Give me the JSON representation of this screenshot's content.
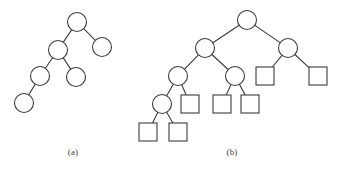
{
  "figure": {
    "background_color": "#ffffff",
    "stroke_color": "#3c3c3c",
    "node_fill": "#ffffff",
    "stroke_width": 1.1,
    "circle_radius": 9.5,
    "square_size": 18,
    "panels": [
      {
        "id": "a",
        "caption": "(a)",
        "caption_x": 73,
        "caption_y": 152,
        "description": "binary tree with internal nodes only",
        "nodes": [
          {
            "id": "a0",
            "shape": "circle",
            "x": 77,
            "y": 22,
            "level": 0,
            "name": "root"
          },
          {
            "id": "a1",
            "shape": "circle",
            "x": 58,
            "y": 50,
            "level": 1,
            "name": "left-child"
          },
          {
            "id": "a2",
            "shape": "circle",
            "x": 102,
            "y": 47,
            "level": 1,
            "name": "right-child"
          },
          {
            "id": "a3",
            "shape": "circle",
            "x": 40,
            "y": 76,
            "level": 2,
            "name": "left-left-child"
          },
          {
            "id": "a4",
            "shape": "circle",
            "x": 76,
            "y": 77,
            "level": 2,
            "name": "left-right-child"
          },
          {
            "id": "a5",
            "shape": "circle",
            "x": 24,
            "y": 103,
            "level": 3,
            "name": "left-left-left-child"
          }
        ],
        "edges": [
          {
            "from": "a0",
            "to": "a1"
          },
          {
            "from": "a0",
            "to": "a2"
          },
          {
            "from": "a1",
            "to": "a3"
          },
          {
            "from": "a1",
            "to": "a4"
          },
          {
            "from": "a3",
            "to": "a5"
          }
        ]
      },
      {
        "id": "b",
        "caption": "(b)",
        "caption_x": 232,
        "caption_y": 152,
        "description": "extended binary tree: circles are internal nodes, squares are external (leaf) nodes",
        "nodes": [
          {
            "id": "b0",
            "shape": "circle",
            "x": 247,
            "y": 20,
            "level": 0,
            "name": "root"
          },
          {
            "id": "b1",
            "shape": "circle",
            "x": 205,
            "y": 48,
            "level": 1,
            "name": "internal-left"
          },
          {
            "id": "b2",
            "shape": "circle",
            "x": 288,
            "y": 48,
            "level": 1,
            "name": "internal-right"
          },
          {
            "id": "b3",
            "shape": "circle",
            "x": 178,
            "y": 76,
            "level": 2,
            "name": "internal-left-left"
          },
          {
            "id": "b4",
            "shape": "circle",
            "x": 235,
            "y": 76,
            "level": 2,
            "name": "internal-left-right"
          },
          {
            "id": "b5",
            "shape": "square",
            "x": 265,
            "y": 76,
            "level": 2,
            "name": "external-right-left"
          },
          {
            "id": "b6",
            "shape": "square",
            "x": 318,
            "y": 76,
            "level": 2,
            "name": "external-right-right"
          },
          {
            "id": "b7",
            "shape": "circle",
            "x": 162,
            "y": 104,
            "level": 3,
            "name": "internal-deep"
          },
          {
            "id": "b8",
            "shape": "square",
            "x": 190,
            "y": 104,
            "level": 3,
            "name": "external-1"
          },
          {
            "id": "b9",
            "shape": "square",
            "x": 222,
            "y": 104,
            "level": 3,
            "name": "external-2"
          },
          {
            "id": "b10",
            "shape": "square",
            "x": 250,
            "y": 104,
            "level": 3,
            "name": "external-3"
          },
          {
            "id": "b11",
            "shape": "square",
            "x": 148,
            "y": 132,
            "level": 4,
            "name": "external-4"
          },
          {
            "id": "b12",
            "shape": "square",
            "x": 178,
            "y": 132,
            "level": 4,
            "name": "external-5"
          }
        ],
        "edges": [
          {
            "from": "b0",
            "to": "b1"
          },
          {
            "from": "b0",
            "to": "b2"
          },
          {
            "from": "b1",
            "to": "b3"
          },
          {
            "from": "b1",
            "to": "b4"
          },
          {
            "from": "b2",
            "to": "b5"
          },
          {
            "from": "b2",
            "to": "b6"
          },
          {
            "from": "b3",
            "to": "b7"
          },
          {
            "from": "b3",
            "to": "b8"
          },
          {
            "from": "b4",
            "to": "b9"
          },
          {
            "from": "b4",
            "to": "b10"
          },
          {
            "from": "b7",
            "to": "b11"
          },
          {
            "from": "b7",
            "to": "b12"
          }
        ]
      }
    ]
  }
}
